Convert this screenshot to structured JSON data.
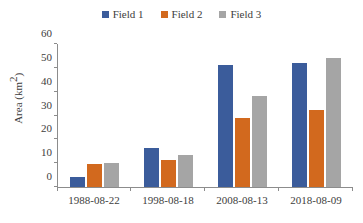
{
  "chart_data": {
    "type": "bar",
    "title": "",
    "subtitle": "",
    "xlabel": "",
    "ylabel": "Area (km²)",
    "ylabel_base": "Area (km",
    "ylabel_sup": "2",
    "ylabel_tail": ")",
    "categories": [
      "1988-08-22",
      "1998-08-18",
      "2008-08-13",
      "2018-08-09"
    ],
    "series": [
      {
        "name": "Field 1",
        "color": "#3B5C9B",
        "values": [
          4,
          16.5,
          51,
          52
        ]
      },
      {
        "name": "Field 2",
        "color": "#D2691E",
        "values": [
          9.7,
          11.5,
          29,
          32.5
        ]
      },
      {
        "name": "Field 3",
        "color": "#A5A5A5",
        "values": [
          10,
          13.5,
          38,
          54
        ]
      }
    ],
    "ylim": [
      0,
      60
    ],
    "yticks": [
      0,
      10,
      20,
      30,
      40,
      50,
      60
    ],
    "ytick_labels": [
      "0",
      "10",
      "20",
      "30",
      "40",
      "50",
      "60"
    ],
    "grid": false,
    "legend_position": "top-center"
  },
  "legend": {
    "entries": [
      {
        "label": "Field 1",
        "swatch_color": "#3B5C9B"
      },
      {
        "label": "Field 2",
        "swatch_color": "#D2691E"
      },
      {
        "label": "Field 3",
        "swatch_color": "#A5A5A5"
      }
    ]
  },
  "axes": {
    "y_title": "Area (km2)",
    "y_tick_labels": [
      "60",
      "50",
      "40",
      "30",
      "20",
      "10",
      "0"
    ],
    "x_tick_labels": [
      "1988-08-22",
      "1998-08-18",
      "2008-08-13",
      "2018-08-09"
    ],
    "axis_color": "#8c8c8c"
  }
}
